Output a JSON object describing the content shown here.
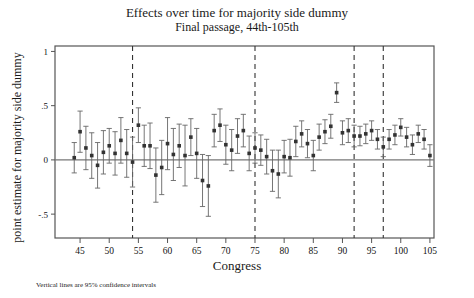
{
  "figure": {
    "title": "Effects over time for majority side dummy",
    "subtitle": "Final passage, 44th-105th",
    "footnote": "Vertical lines are 95% confidence intervals",
    "axis_color": "#555555",
    "point_color": "#333333",
    "ci_color": "#666666",
    "reference_line_color": "#777777",
    "dashed_line_color": "#333333"
  },
  "chart_data": {
    "type": "scatter",
    "title": "Effects over time for majority side dummy",
    "subtitle": "Final passage, 44th-105th",
    "xlabel": "Congress",
    "ylabel": "point estimate for majority side dummy",
    "annotation": "Vertical lines are 95% confidence intervals",
    "xlim": [
      40.7,
      105.7
    ],
    "ylim": [
      -0.72,
      1.05
    ],
    "xticks": [
      45,
      50,
      55,
      60,
      65,
      70,
      75,
      80,
      85,
      90,
      95,
      100,
      105
    ],
    "yticks": [
      1,
      0.5,
      0,
      -0.5
    ],
    "ytick_labels": [
      "1",
      ".5",
      "0",
      "-.5"
    ],
    "grid": false,
    "legend": "none",
    "reference_line_y": 0,
    "vertical_dashed_lines": [
      54,
      75,
      92,
      97
    ],
    "error_bar_type": "95% confidence interval",
    "x": [
      44,
      45,
      46,
      47,
      48,
      49,
      50,
      51,
      52,
      53,
      54,
      55,
      56,
      57,
      58,
      59,
      60,
      61,
      62,
      63,
      64,
      65,
      66,
      67,
      68,
      69,
      70,
      71,
      72,
      73,
      74,
      75,
      76,
      77,
      78,
      79,
      80,
      81,
      82,
      83,
      84,
      85,
      86,
      87,
      88,
      89,
      90,
      91,
      92,
      93,
      94,
      95,
      96,
      97,
      98,
      99,
      100,
      101,
      102,
      103,
      104,
      105
    ],
    "estimate": [
      0.02,
      0.26,
      0.11,
      0.04,
      -0.05,
      0.07,
      0.13,
      0.06,
      0.18,
      0.06,
      -0.02,
      0.32,
      0.13,
      0.13,
      -0.14,
      -0.07,
      0.15,
      0.05,
      0.13,
      0.04,
      0.21,
      0.06,
      -0.19,
      -0.24,
      0.27,
      0.32,
      0.14,
      0.09,
      0.22,
      0.27,
      0.06,
      0.11,
      0.09,
      0.03,
      -0.1,
      -0.13,
      0.03,
      0.02,
      0.17,
      0.24,
      0.15,
      0.04,
      0.21,
      0.26,
      0.31,
      0.62,
      0.25,
      0.27,
      0.22,
      0.22,
      0.24,
      0.27,
      0.19,
      0.12,
      0.19,
      0.23,
      0.3,
      0.21,
      0.14,
      0.24,
      0.19,
      0.04
    ],
    "ci_low": [
      -0.12,
      0.07,
      -0.09,
      -0.17,
      -0.26,
      -0.13,
      -0.03,
      -0.14,
      -0.03,
      -0.16,
      -0.25,
      0.16,
      -0.06,
      -0.08,
      -0.39,
      -0.32,
      -0.09,
      -0.19,
      -0.07,
      -0.24,
      0.04,
      -0.17,
      -0.43,
      -0.52,
      0.12,
      0.17,
      -0.04,
      -0.1,
      0.06,
      0.12,
      -0.1,
      -0.03,
      -0.05,
      -0.13,
      -0.29,
      -0.35,
      -0.12,
      -0.15,
      0.03,
      0.12,
      0.02,
      -0.1,
      0.09,
      0.15,
      0.2,
      0.53,
      0.14,
      0.16,
      0.12,
      0.13,
      0.15,
      0.18,
      0.1,
      0.03,
      0.1,
      0.14,
      0.22,
      0.12,
      0.05,
      0.16,
      0.1,
      -0.06
    ],
    "ci_high": [
      0.16,
      0.45,
      0.31,
      0.25,
      0.16,
      0.27,
      0.29,
      0.26,
      0.39,
      0.28,
      0.21,
      0.48,
      0.32,
      0.34,
      0.11,
      0.18,
      0.39,
      0.29,
      0.33,
      0.32,
      0.38,
      0.29,
      0.05,
      0.04,
      0.42,
      0.47,
      0.32,
      0.28,
      0.38,
      0.42,
      0.22,
      0.25,
      0.23,
      0.19,
      0.09,
      0.09,
      0.18,
      0.19,
      0.31,
      0.36,
      0.28,
      0.18,
      0.33,
      0.37,
      0.42,
      0.71,
      0.36,
      0.38,
      0.32,
      0.31,
      0.33,
      0.36,
      0.28,
      0.21,
      0.28,
      0.32,
      0.38,
      0.3,
      0.23,
      0.32,
      0.28,
      0.14
    ]
  }
}
